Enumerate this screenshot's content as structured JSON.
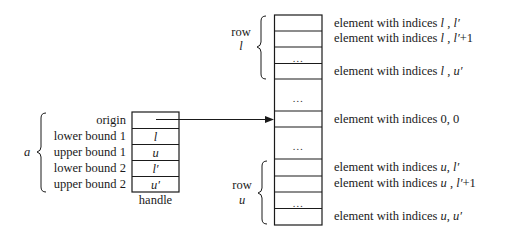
{
  "handle": {
    "group_label": "a",
    "caption": "handle",
    "fields": [
      {
        "label": "origin",
        "value": ""
      },
      {
        "label": "lower bound 1",
        "value": "l"
      },
      {
        "label": "upper bound 1",
        "value": "u"
      },
      {
        "label": "lower bound 2",
        "value": "l′"
      },
      {
        "label": "upper bound 2",
        "value": "u′"
      }
    ]
  },
  "array": {
    "row_l": {
      "word": "row",
      "index": "l"
    },
    "row_u": {
      "word": "row",
      "index": "u"
    },
    "ellipsis": "…",
    "elements": [
      {
        "prefix": "element with indices ",
        "i": "l",
        "sep": " , ",
        "j": "l′",
        "suffix": ""
      },
      {
        "prefix": "element with indices ",
        "i": "l",
        "sep": " , ",
        "j": "l′",
        "suffix": "+1"
      },
      {
        "prefix": "element with indices ",
        "i": "l",
        "sep": " , ",
        "j": "u′",
        "suffix": ""
      },
      {
        "prefix": "element with indices 0, 0",
        "i": "",
        "sep": "",
        "j": "",
        "suffix": ""
      },
      {
        "prefix": "element with indices ",
        "i": "u",
        "sep": ", ",
        "j": "l′",
        "suffix": ""
      },
      {
        "prefix": "element with indices ",
        "i": "u",
        "sep": " , ",
        "j": "l′",
        "suffix": "+1"
      },
      {
        "prefix": "element with indices ",
        "i": "u",
        "sep": ", ",
        "j": "u′",
        "suffix": ""
      }
    ]
  }
}
